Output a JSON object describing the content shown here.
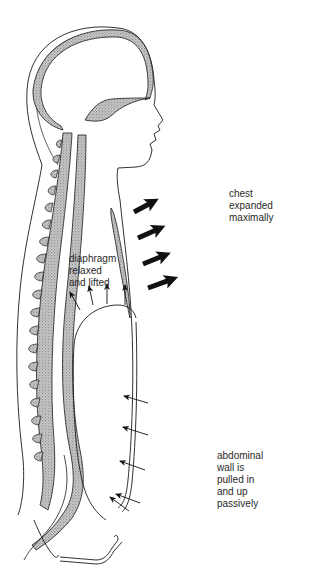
{
  "diagram": {
    "labels": {
      "chest": [
        "chest",
        "expanded",
        "maximally"
      ],
      "diaphragm": [
        "diaphragm",
        "relaxed",
        "and lifted"
      ],
      "abdominal": [
        "abdominal",
        "wall is",
        "pulled in",
        "and up",
        "passively"
      ]
    },
    "arrows": {
      "chest_outward": 4,
      "diaphragm_upward": 4,
      "abdomen_inward": 5
    },
    "colors": {
      "line": "#1a1a1a",
      "stipple": "#9a9a9a",
      "background": "#ffffff"
    }
  }
}
